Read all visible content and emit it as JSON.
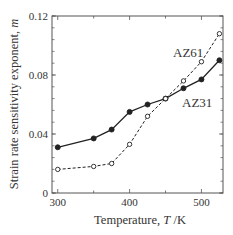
{
  "chart_data": {
    "type": "line",
    "title": "",
    "xlabel": "Temperature, T /K",
    "xlabel_parts": {
      "prefix": "Temperature, ",
      "var": "T",
      "suffix": " /K"
    },
    "ylabel": "Strain rate sensitivity exponent, m",
    "ylabel_parts": {
      "prefix": "Strain rate sensitivity exponent, ",
      "var": "m"
    },
    "xlim": [
      292,
      530
    ],
    "ylim": [
      0,
      0.12
    ],
    "x_ticks": [
      300,
      400,
      500
    ],
    "x_tick_labels": [
      "300",
      "400",
      "500"
    ],
    "x_minor_ticks": [
      350,
      450
    ],
    "y_ticks": [
      0,
      0.04,
      0.08,
      0.12
    ],
    "y_tick_labels": [
      "0",
      "0.04",
      "0.08",
      "0.12"
    ],
    "y_minor_step": 0.008,
    "grid": false,
    "legend": "inline labels",
    "series": [
      {
        "name": "AZ31",
        "style": "solid",
        "marker": "filled-circle",
        "x": [
          300,
          350,
          375,
          400,
          425,
          450,
          475,
          500,
          525
        ],
        "values": [
          0.031,
          0.037,
          0.043,
          0.055,
          0.06,
          0.064,
          0.071,
          0.077,
          0.09
        ],
        "label_pos": {
          "x": 182,
          "y": 107
        }
      },
      {
        "name": "AZ61",
        "style": "dashed",
        "marker": "open-circle",
        "x": [
          300,
          350,
          375,
          400,
          425,
          450,
          475,
          500,
          525
        ],
        "values": [
          0.016,
          0.018,
          0.02,
          0.033,
          0.052,
          0.064,
          0.076,
          0.089,
          0.108
        ],
        "label_pos": {
          "x": 173,
          "y": 57
        }
      }
    ]
  },
  "colors": {
    "axis": "#555555",
    "line": "#222222",
    "text": "#333333"
  }
}
